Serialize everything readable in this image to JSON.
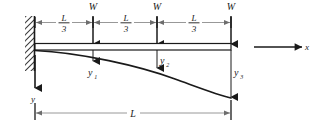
{
  "figure": {
    "support": "fixed-wall-left",
    "beam_label": "",
    "loads": [
      {
        "label": "W",
        "x_fraction": "L/3"
      },
      {
        "label": "W",
        "x_fraction": "2L/3"
      },
      {
        "label": "W",
        "x_fraction": "L"
      }
    ],
    "segment_labels": [
      {
        "numerator": "L",
        "denominator": "3"
      },
      {
        "numerator": "L",
        "denominator": "3"
      },
      {
        "numerator": "L",
        "denominator": "3"
      }
    ],
    "deflections": [
      {
        "base": "y",
        "sub": "1"
      },
      {
        "base": "y",
        "sub": "2"
      },
      {
        "base": "y",
        "sub": "3"
      }
    ],
    "axes": [
      {
        "name": "x",
        "label": "x",
        "direction": "right"
      },
      {
        "name": "y",
        "label": "y",
        "direction": "down"
      }
    ],
    "overall_dimension": {
      "label": "L"
    },
    "colors": {
      "line": "#1a1a1a",
      "dimension_line": "#8c8c8c",
      "background": "#ffffff",
      "hatch": "#3a3a3a"
    }
  }
}
